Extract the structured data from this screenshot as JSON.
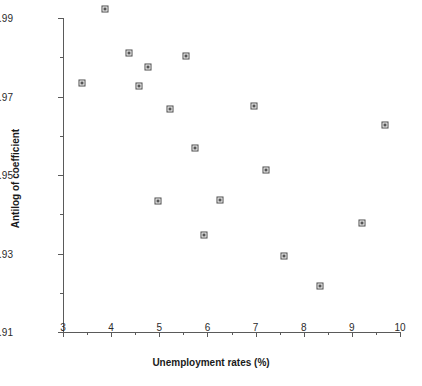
{
  "chart_data": {
    "type": "scatter",
    "title": "",
    "xlabel": "Unemployment rates (%)",
    "ylabel": "Antilog of coefficient",
    "xlim": [
      3,
      10
    ],
    "ylim": [
      0.91,
      0.99
    ],
    "grid": false,
    "legend": null,
    "x_ticks": [
      {
        "value": 3,
        "label": "3",
        "major": true
      },
      {
        "value": 3.5,
        "label": "",
        "major": false
      },
      {
        "value": 4,
        "label": "4",
        "major": true
      },
      {
        "value": 4.5,
        "label": "",
        "major": false
      },
      {
        "value": 5,
        "label": "5",
        "major": true
      },
      {
        "value": 5.5,
        "label": "",
        "major": false
      },
      {
        "value": 6,
        "label": "6",
        "major": true
      },
      {
        "value": 6.5,
        "label": "",
        "major": false
      },
      {
        "value": 7,
        "label": "7",
        "major": true
      },
      {
        "value": 7.5,
        "label": "",
        "major": false
      },
      {
        "value": 8,
        "label": "8",
        "major": true
      },
      {
        "value": 8.5,
        "label": "",
        "major": false
      },
      {
        "value": 9,
        "label": "9",
        "major": true
      },
      {
        "value": 9.5,
        "label": "",
        "major": false
      },
      {
        "value": 10,
        "label": "10",
        "major": true
      }
    ],
    "y_ticks": [
      {
        "value": 0.91,
        "label": "0.91",
        "major": true
      },
      {
        "value": 0.92,
        "label": "",
        "major": false
      },
      {
        "value": 0.93,
        "label": "0.93",
        "major": true
      },
      {
        "value": 0.94,
        "label": "",
        "major": false
      },
      {
        "value": 0.95,
        "label": "0.95",
        "major": true
      },
      {
        "value": 0.96,
        "label": "",
        "major": false
      },
      {
        "value": 0.97,
        "label": "0.97",
        "major": true
      },
      {
        "value": 0.98,
        "label": "",
        "major": false
      },
      {
        "value": 0.99,
        "label": "0.99",
        "major": true
      }
    ],
    "points": [
      {
        "x": 3.39,
        "y": 0.9735
      },
      {
        "x": 3.88,
        "y": 0.9923
      },
      {
        "x": 4.37,
        "y": 0.9812
      },
      {
        "x": 4.57,
        "y": 0.9726
      },
      {
        "x": 4.77,
        "y": 0.9775
      },
      {
        "x": 4.97,
        "y": 0.9434
      },
      {
        "x": 5.22,
        "y": 0.9668
      },
      {
        "x": 5.55,
        "y": 0.9802
      },
      {
        "x": 5.74,
        "y": 0.957
      },
      {
        "x": 5.93,
        "y": 0.9348
      },
      {
        "x": 6.26,
        "y": 0.9437
      },
      {
        "x": 6.97,
        "y": 0.9675
      },
      {
        "x": 7.22,
        "y": 0.9512
      },
      {
        "x": 7.59,
        "y": 0.9293
      },
      {
        "x": 8.34,
        "y": 0.9217
      },
      {
        "x": 9.21,
        "y": 0.9377
      },
      {
        "x": 9.69,
        "y": 0.9628
      }
    ],
    "colors": {
      "marker_edge": "#4a4a4a",
      "marker_fill": "#ffffff",
      "marker_core": "#555555",
      "axis": "#5a5a5a",
      "text": "#1a1a1a",
      "background": "#ffffff"
    }
  }
}
